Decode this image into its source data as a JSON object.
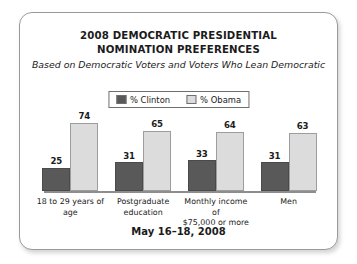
{
  "figure": {
    "title_line1": "2008 DEMOCRATIC PRESIDENTIAL",
    "title_line2": "NOMINATION PREFERENCES",
    "subtitle": "Based on Democratic Voters and Voters Who Lean Democratic",
    "footer_date": "May 16–18, 2008"
  },
  "legend": {
    "entries": [
      {
        "label": "% Clinton",
        "color": "#595959"
      },
      {
        "label": "% Obama",
        "color": "#dcdcdc"
      }
    ]
  },
  "chart_data": {
    "type": "bar",
    "title": "2008 DEMOCRATIC PRESIDENTIAL NOMINATION PREFERENCES",
    "subtitle": "Based on Democratic Voters and Voters Who Lean Democratic",
    "xlabel": "",
    "ylabel": "",
    "ylim": [
      0,
      80
    ],
    "grid": false,
    "legend_position": "top-center",
    "value_labels": true,
    "categories": [
      "18 to 29 years of age",
      "Postgraduate education",
      "Monthly income of $75,000 or more",
      "Men"
    ],
    "category_lines": [
      [
        "18 to 29 years of age"
      ],
      [
        "Postgraduate",
        "education"
      ],
      [
        "Monthly income of",
        "$75,000 or more"
      ],
      [
        "Men"
      ]
    ],
    "series": [
      {
        "name": "% Clinton",
        "color": "#595959",
        "values": [
          25,
          31,
          33,
          31
        ]
      },
      {
        "name": "% Obama",
        "color": "#dcdcdc",
        "values": [
          74,
          65,
          64,
          63
        ]
      }
    ],
    "annotation": "May 16–18, 2008"
  }
}
